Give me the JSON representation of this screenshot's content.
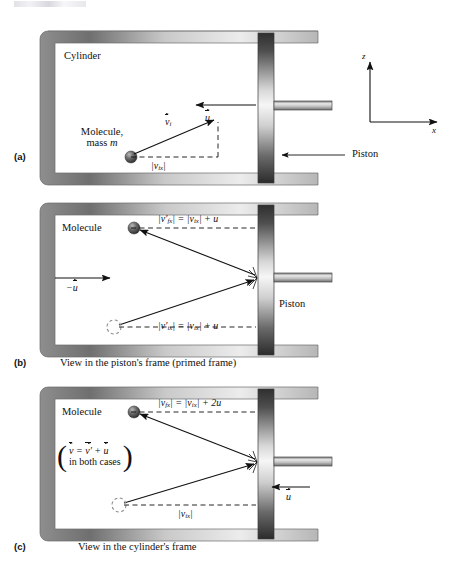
{
  "figure": {
    "title_visible": false,
    "axes": {
      "z_label": "z",
      "x_label": "x"
    },
    "colors": {
      "ink": "#111111",
      "wall_light": "#f2f2f2",
      "wall_mid": "#9a9a9a",
      "wall_dark": "#6e6e6e",
      "piston_dark": "#3a3a3a",
      "piston_light": "#f4f4f4",
      "molecule": "#4a4a4a"
    }
  },
  "panels": [
    {
      "tag": "(a)",
      "caption": "",
      "cylinder_label": "Cylinder",
      "piston_label": "Piston",
      "molecule_label_line1": "Molecule,",
      "molecule_label_line2": "mass m",
      "molecule_mass_symbol": "m",
      "velocity_vector_label": "v",
      "velocity_vector_subscript": "i",
      "piston_velocity_label": "u",
      "component_label": "|v",
      "component_subscript": "ix",
      "component_label_close": "|"
    },
    {
      "tag": "(b)",
      "caption": "View in the piston's frame (primed frame)",
      "molecule_label": "Molecule",
      "piston_label": "Piston",
      "frame_velocity_label": "−u",
      "formula_top": {
        "lhs_open": "|v′",
        "lhs_sub": "fx",
        "lhs_close": "| = |v",
        "rhs_sub": "ix",
        "rhs_close": "| + u"
      },
      "formula_bottom": {
        "lhs_open": "|v′",
        "lhs_sub": "ix",
        "lhs_close": "| = |v",
        "rhs_sub": "ix",
        "rhs_close": "| + u"
      }
    },
    {
      "tag": "(c)",
      "caption": "View in the cylinder's frame",
      "molecule_label": "Molecule",
      "piston_velocity_label": "u",
      "note_line1_lhs": "v",
      "note_line1_mid": " = ",
      "note_line1_rhs1": "v′",
      "note_line1_plus": " + ",
      "note_line1_rhs2": "u",
      "note_line2": "in both cases",
      "formula_top": {
        "lhs_open": "|v",
        "lhs_sub": "fx",
        "lhs_close": "| = |v",
        "rhs_sub": "ix",
        "rhs_close": "| + 2u"
      },
      "formula_bottom": {
        "open": "|v",
        "sub": "ix",
        "close": "|"
      }
    }
  ]
}
